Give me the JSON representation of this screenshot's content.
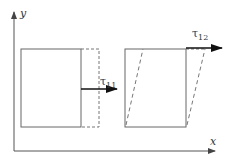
{
  "diagram": {
    "axes": {
      "x_label": "x",
      "y_label": "y"
    },
    "left_element": {
      "description": "normal stress deformation",
      "stress_label": "τ",
      "stress_subscript": "11"
    },
    "right_element": {
      "description": "shear stress deformation",
      "stress_label": "τ",
      "stress_subscript": "12"
    },
    "colors": {
      "line": "#555555",
      "dashed": "#777777",
      "arrow": "#111111"
    }
  }
}
